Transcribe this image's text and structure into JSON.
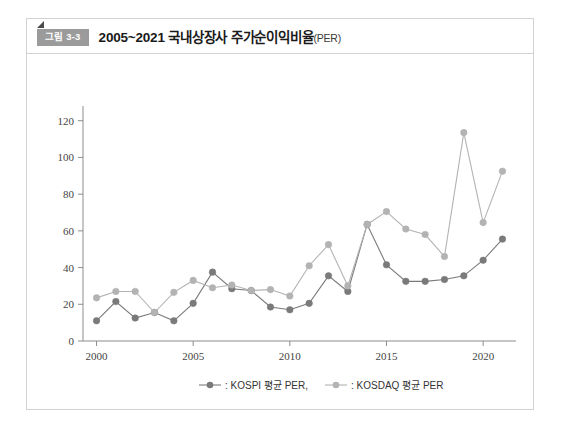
{
  "figure": {
    "badge": "그림 3-3",
    "title": "2005~2021 국내상장사 주가순이익비율",
    "title_suffix": "(PER)",
    "badge_color": "#9b9b9b",
    "border_color": "#d2d2d2"
  },
  "chart_data": {
    "type": "line",
    "title": "2005~2021 국내상장사 주가순이익비율(PER)",
    "xlabel": "",
    "ylabel": "",
    "xlim": [
      1999.3,
      2021.7
    ],
    "ylim": [
      0,
      128
    ],
    "xticks": [
      2000,
      2005,
      2010,
      2015,
      2020
    ],
    "yticks": [
      0,
      20,
      40,
      60,
      80,
      100,
      120
    ],
    "grid": false,
    "legend_position": "bottom",
    "x": [
      2000,
      2001,
      2002,
      2003,
      2004,
      2005,
      2006,
      2007,
      2008,
      2009,
      2010,
      2011,
      2012,
      2013,
      2014,
      2015,
      2016,
      2017,
      2018,
      2019,
      2020,
      2021
    ],
    "series": [
      {
        "name": ": KOSPI 평균 PER,",
        "legend_text": ": KOSPI 평균 PER,",
        "color": "#7a7a7a",
        "values": [
          11,
          21.5,
          12.5,
          15.5,
          11,
          20.5,
          37.5,
          28.5,
          27.5,
          18.5,
          17,
          20.5,
          35.5,
          27,
          63.5,
          41.5,
          32.5,
          32.5,
          33.5,
          35.5,
          44,
          55.5
        ]
      },
      {
        "name": ": KOSDAQ 평균 PER",
        "legend_text": ": KOSDAQ 평균 PER",
        "color": "#b3b3b3",
        "values": [
          23.5,
          27,
          27,
          15.5,
          26.5,
          33,
          29,
          30.5,
          27.5,
          28,
          24.5,
          41,
          52.5,
          30,
          63.5,
          70.5,
          61,
          58,
          46,
          113.5,
          64.5,
          92.5
        ]
      }
    ]
  }
}
